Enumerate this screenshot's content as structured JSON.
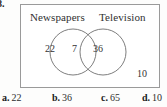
{
  "question": {
    "number": "8."
  },
  "venn": {
    "left_label": "Newspapers",
    "right_label": "Television",
    "left_only": "22",
    "intersection": "7",
    "right_only": "36",
    "outside": "10"
  },
  "choices": [
    {
      "tag": "a.",
      "value": "22"
    },
    {
      "tag": "b.",
      "value": "36"
    },
    {
      "tag": "c.",
      "value": "65"
    },
    {
      "tag": "d.",
      "value": "10"
    }
  ],
  "colors": {
    "ink": "#2b2b2b",
    "rule": "#9a9a9a",
    "paper": "#fdfdfc"
  }
}
